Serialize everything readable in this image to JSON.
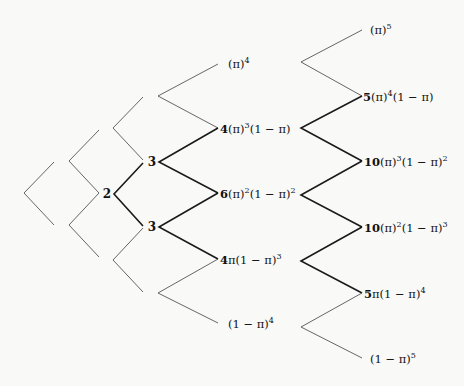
{
  "diagram": {
    "nodes": {
      "level2": "2",
      "level3_top": "3",
      "level3_bottom": "3"
    },
    "level4": [
      {
        "coef": "",
        "base": "(π)",
        "exp": "4",
        "tail": "",
        "tail_exp": ""
      },
      {
        "coef": "4",
        "base": "(π)",
        "exp": "3",
        "tail": "(1 − π)",
        "tail_exp": ""
      },
      {
        "coef": "6",
        "base": "(π)",
        "exp": "2",
        "tail": "(1 − π)",
        "tail_exp": "2"
      },
      {
        "coef": "4",
        "base": "π",
        "exp": "",
        "tail": "(1 − π)",
        "tail_exp": "3"
      },
      {
        "coef": "",
        "base": "(1 − π)",
        "exp": "4",
        "tail": "",
        "tail_exp": ""
      }
    ],
    "level5": [
      {
        "coef": "",
        "base": "(π)",
        "exp": "5",
        "tail": "",
        "tail_exp": ""
      },
      {
        "coef": "5",
        "base": "(π)",
        "exp": "4",
        "tail": "(1 − π)",
        "tail_exp": ""
      },
      {
        "coef": "10",
        "base": "(π)",
        "exp": "3",
        "tail": "(1 − π)",
        "tail_exp": "2"
      },
      {
        "coef": "10",
        "base": "(π)",
        "exp": "2",
        "tail": "(1 − π)",
        "tail_exp": "3"
      },
      {
        "coef": "5",
        "base": "π",
        "exp": "",
        "tail": "(1 − π)",
        "tail_exp": "4"
      },
      {
        "coef": "",
        "base": "(1 − π)",
        "exp": "5",
        "tail": "",
        "tail_exp": ""
      }
    ]
  }
}
